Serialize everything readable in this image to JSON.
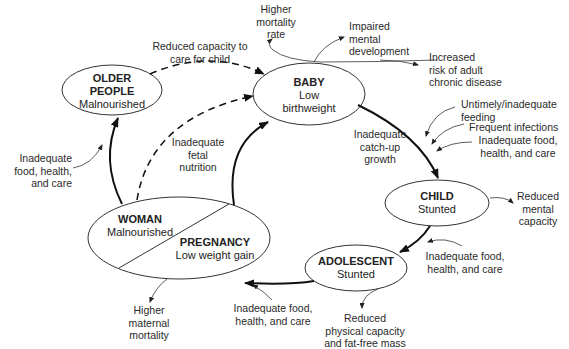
{
  "diagram": {
    "type": "cycle",
    "nodes": {
      "baby": {
        "title": "BABY",
        "line1": "Low",
        "line2": "birthweight"
      },
      "child": {
        "title": "CHILD",
        "line1": "Stunted"
      },
      "adolescent": {
        "title": "ADOLESCENT",
        "line1": "Stunted"
      },
      "woman": {
        "title": "WOMAN",
        "line1": "Malnourished"
      },
      "pregnancy": {
        "title": "PREGNANCY",
        "line1": "Low weight gain"
      },
      "older": {
        "title1": "OLDER",
        "title2": "PEOPLE",
        "line1": "Malnourished"
      }
    },
    "labels": {
      "higher_mortality": [
        "Higher",
        "mortality",
        "rate"
      ],
      "impaired_mental": [
        "Impaired",
        "mental",
        "development"
      ],
      "increased_risk": [
        "Increased",
        "risk of adult",
        "chronic disease"
      ],
      "reduced_capacity_care": [
        "Reduced capacity to",
        "care for child"
      ],
      "untimely_feeding": [
        "Untimely/inadequate",
        "feeding"
      ],
      "frequent_infections": [
        "Frequent infections"
      ],
      "inadequate_child": [
        "Inadequate food,",
        "health, and care"
      ],
      "catch_up": [
        "Inadequate",
        "catch-up",
        "growth"
      ],
      "reduced_mental_capacity": [
        "Reduced",
        "mental",
        "capacity"
      ],
      "inadequate_adolescent": [
        "Inadequate food,",
        "health, and care"
      ],
      "reduced_physical": [
        "Reduced",
        "physical capacity",
        "and fat-free mass"
      ],
      "inadequate_pregnancy": [
        "Inadequate food,",
        "health, and care"
      ],
      "higher_maternal": [
        "Higher",
        "maternal",
        "mortality"
      ],
      "inadequate_older": [
        "Inadequate",
        "food, health,",
        "and care"
      ],
      "fetal_nutrition": [
        "Inadequate",
        "fetal",
        "nutrition"
      ]
    }
  }
}
